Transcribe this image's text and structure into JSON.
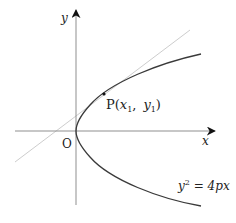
{
  "diagram": {
    "axes": {
      "x_label": "x",
      "y_label": "y",
      "origin_label": "O"
    },
    "point": {
      "name": "P",
      "coord_open": "(",
      "x_sym": "x",
      "x_sub": "1",
      "sep": ",",
      "y_sym": "y",
      "y_sub": "1",
      "coord_close": ")"
    },
    "curve": {
      "equation_lhs": "y",
      "equation_exp": "2",
      "equation_rhs": " = 4px"
    },
    "colors": {
      "curve": "#3a3a3a",
      "axes": "#9a9a9a",
      "tangent": "#cfcfcf"
    }
  }
}
